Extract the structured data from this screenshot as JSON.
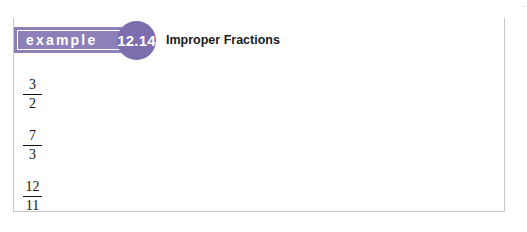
{
  "example": {
    "label": "example",
    "number": "12.14",
    "title": "Improper Fractions"
  },
  "fractions": [
    {
      "numerator": "3",
      "denominator": "2"
    },
    {
      "numerator": "7",
      "denominator": "3"
    },
    {
      "numerator": "12",
      "denominator": "11"
    }
  ],
  "colors": {
    "band": "#8d7fb8",
    "circle": "#7e6dae",
    "border": "#c9c9c9",
    "text": "#1a1a1a"
  }
}
